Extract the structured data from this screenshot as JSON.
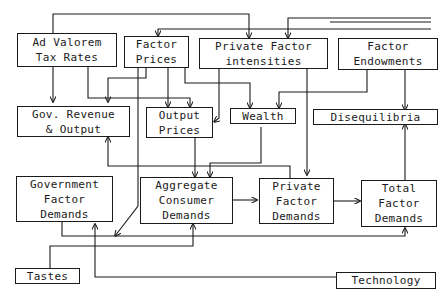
{
  "diagram": {
    "nodes": {
      "ad_valorem": "Ad Valorem\nTax Rates",
      "factor_prices": "Factor\nPrices",
      "private_factor_intensities": "Private Factor\nintensities",
      "factor_endowments": "Factor\nEndowments",
      "gov_revenue": "Gov. Revenue\n& Output",
      "output_prices": "Output\nPrices",
      "wealth": "Wealth",
      "disequilibria": "Disequilibria",
      "gov_factor_demands": "Government\nFactor\nDemands",
      "aggregate_consumer_demands": "Aggregate\nConsumer\nDemands",
      "private_factor_demands": "Private\nFactor\nDemands",
      "total_factor_demands": "Total\nFactor\nDemands",
      "tastes": "Tastes",
      "technology": "Technology"
    },
    "edges": [
      [
        "Ad Valorem Tax Rates",
        "Gov. Revenue & Output"
      ],
      [
        "Ad Valorem Tax Rates",
        "Output Prices"
      ],
      [
        "Ad Valorem Tax Rates",
        "Private Factor intensities"
      ],
      [
        "Factor Prices",
        "Gov. Revenue & Output"
      ],
      [
        "Factor Prices",
        "Output Prices"
      ],
      [
        "Factor Prices",
        "Wealth"
      ],
      [
        "Factor Prices",
        "Government Factor Demands"
      ],
      [
        "Private Factor intensities",
        "Output Prices"
      ],
      [
        "Private Factor intensities",
        "Private Factor Demands"
      ],
      [
        "Factor Endowments",
        "Wealth"
      ],
      [
        "Factor Endowments",
        "Disequilibria"
      ],
      [
        "Output Prices",
        "Aggregate Consumer Demands"
      ],
      [
        "Wealth",
        "Aggregate Consumer Demands"
      ],
      [
        "Aggregate Consumer Demands",
        "Private Factor Demands"
      ],
      [
        "Private Factor Demands",
        "Total Factor Demands"
      ],
      [
        "Private Factor Demands",
        "Gov. Revenue & Output"
      ],
      [
        "Total Factor Demands",
        "Disequilibria"
      ],
      [
        "Government Factor Demands",
        "Total Factor Demands"
      ],
      [
        "Tastes",
        "Aggregate Consumer Demands"
      ],
      [
        "Technology",
        "Government Factor Demands"
      ],
      [
        "(off-screen)",
        "Factor Prices"
      ],
      [
        "(off-screen)",
        "Private Factor intensities"
      ]
    ]
  }
}
